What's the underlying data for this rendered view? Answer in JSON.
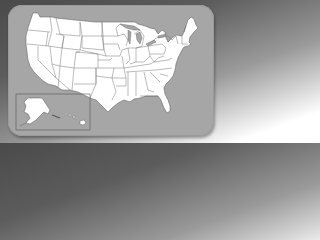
{
  "map": {
    "title": "",
    "region": "United States",
    "style": "white states with grey borders on grey rounded card",
    "inset": {
      "contains": [
        "Alaska",
        "Hawaii"
      ],
      "position": "bottom-left"
    }
  },
  "colors": {
    "background_dark": "#4a4a4a",
    "background_light": "#ffffff",
    "card": "#a6a6a6",
    "land": "#ffffff",
    "borders": "#555555"
  }
}
